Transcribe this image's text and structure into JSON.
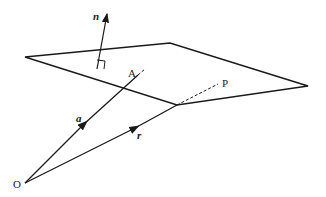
{
  "diagram": {
    "labels": {
      "normal": "n",
      "point_a": "A",
      "point_p": "P",
      "vector_a": "a",
      "vector_r": "r",
      "origin": "O"
    },
    "colors": {
      "stroke": "#1a1a1a",
      "background": "#ffffff"
    }
  }
}
